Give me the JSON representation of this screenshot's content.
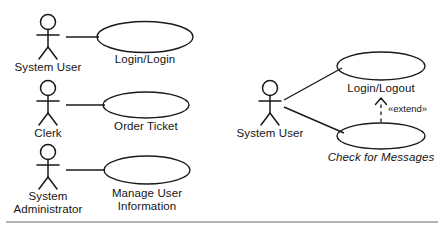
{
  "diagram": {
    "type": "uml-use-case-diagram",
    "colors": {
      "stroke": "#1a1a1a",
      "background": "#ffffff",
      "rule": "#9a9a9a"
    },
    "left_group": {
      "rows": [
        {
          "actor": "System User",
          "use_case": "Login/Login"
        },
        {
          "actor": "Clerk",
          "use_case": "Order Ticket"
        },
        {
          "actor": "System Administrator",
          "actor_line_1": "System",
          "actor_line_2": "Administrator",
          "use_case": "Manage User Information",
          "use_case_line_1": "Manage User",
          "use_case_line_2": "Information"
        }
      ]
    },
    "right_group": {
      "actor": "System User",
      "use_cases": [
        {
          "name": "Login/Logout",
          "italic": false
        },
        {
          "name": "Check for Messages",
          "italic": true
        }
      ],
      "relationship": {
        "stereotype": "«extend»",
        "style": "dashed-open-arrow",
        "from": "Check for Messages",
        "to": "Login/Logout"
      }
    },
    "footer_rule": {
      "present": true
    }
  }
}
